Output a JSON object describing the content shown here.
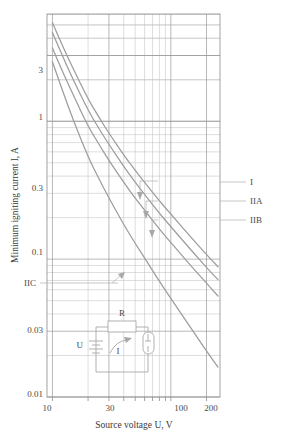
{
  "chart_data": {
    "type": "line",
    "title": "",
    "xlabel": "Source voltage U, V",
    "ylabel": "Minimum igniting current I, A",
    "xscale": "log",
    "yscale": "log",
    "xlim": [
      9,
      260
    ],
    "ylim": [
      0.01,
      6
    ],
    "grid": true,
    "legend_position": "right-inline-labels",
    "xticks": [
      10,
      30,
      100,
      200
    ],
    "xticklabels": [
      "10",
      "30",
      "100",
      "200"
    ],
    "yticks": [
      0.01,
      0.03,
      0.1,
      0.3,
      1,
      3
    ],
    "yticklabels": [
      "0.01",
      "0.03",
      "0.1",
      "0.3",
      "1",
      "3"
    ],
    "series": [
      {
        "name": "I",
        "label": "I",
        "x": [
          10,
          12,
          15,
          20,
          25,
          30,
          40,
          50,
          60,
          80,
          100,
          150,
          200,
          250
        ],
        "y": [
          5.2,
          3.6,
          2.4,
          1.45,
          1.05,
          0.82,
          0.57,
          0.44,
          0.36,
          0.265,
          0.212,
          0.142,
          0.108,
          0.088
        ]
      },
      {
        "name": "IIA",
        "label": "IIA",
        "x": [
          10,
          12,
          15,
          20,
          25,
          30,
          40,
          50,
          60,
          80,
          100,
          150,
          200,
          250
        ],
        "y": [
          4.4,
          3.05,
          2.0,
          1.2,
          0.87,
          0.68,
          0.47,
          0.36,
          0.295,
          0.215,
          0.172,
          0.115,
          0.087,
          0.071
        ]
      },
      {
        "name": "IIB",
        "label": "IIB",
        "x": [
          10,
          12,
          15,
          20,
          25,
          30,
          40,
          50,
          60,
          80,
          100,
          150,
          200,
          250
        ],
        "y": [
          3.4,
          2.35,
          1.55,
          0.92,
          0.67,
          0.52,
          0.36,
          0.277,
          0.227,
          0.165,
          0.132,
          0.088,
          0.067,
          0.054
        ]
      },
      {
        "name": "IIC",
        "label": "IIC",
        "x": [
          10,
          12,
          15,
          20,
          25,
          30,
          40,
          50,
          60,
          80,
          100,
          150,
          200,
          250
        ],
        "y": [
          2.7,
          1.72,
          1.02,
          0.55,
          0.375,
          0.278,
          0.178,
          0.13,
          0.102,
          0.069,
          0.052,
          0.031,
          0.0215,
          0.0165
        ]
      }
    ],
    "annotations": [
      {
        "name": "label-I",
        "text": "I",
        "side": "right"
      },
      {
        "name": "label-IIA",
        "text": "IIA",
        "side": "right"
      },
      {
        "name": "label-IIB",
        "text": "IIB",
        "side": "right"
      },
      {
        "name": "label-IIC",
        "text": "IIC",
        "side": "left"
      }
    ]
  },
  "axes": {
    "x_title": "Source voltage U, V",
    "y_title": "Minimum igniting current I, A",
    "x_tick_10": "10",
    "x_tick_30": "30",
    "x_tick_100": "100",
    "x_tick_200": "200",
    "y_tick_3": "3",
    "y_tick_1": "1",
    "y_tick_03": "0.3",
    "y_tick_01": "0.1",
    "y_tick_003": "0.03",
    "y_tick_001": "0.01"
  },
  "curve_labels": {
    "I": "I",
    "IIA": "IIA",
    "IIB": "IIB",
    "IIC": "IIC"
  },
  "inset": {
    "name": "test-circuit-diagram",
    "resistor_label": "R",
    "source_label": "U",
    "current_label": "I",
    "components": [
      "resistor",
      "battery",
      "current-arrow",
      "spark-gap"
    ]
  },
  "colors": {
    "curve": "#9d9d9d",
    "grid_major": "#9a9a9a",
    "grid_minor": "#c2c2c2",
    "text": "#3a3a3a",
    "background": "#ffffff"
  }
}
